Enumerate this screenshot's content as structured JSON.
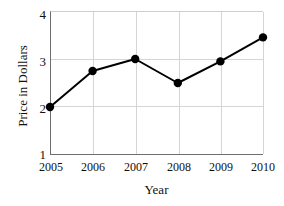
{
  "chart_data": {
    "type": "line",
    "title": "",
    "xlabel": "Year",
    "ylabel": "Price in Dollars",
    "categories": [
      "2005",
      "2006",
      "2007",
      "2008",
      "2009",
      "2010"
    ],
    "values": [
      2.0,
      2.75,
      3.0,
      2.5,
      2.95,
      3.45
    ],
    "series": [
      {
        "name": "Price",
        "values": [
          2.0,
          2.75,
          3.0,
          2.5,
          2.95,
          3.45
        ]
      }
    ],
    "x": [
      2005,
      2006,
      2007,
      2008,
      2009,
      2010
    ],
    "ylim": [
      1,
      4
    ],
    "yticks": [
      1,
      2,
      3,
      4
    ],
    "ytick_labels": [
      "1",
      "2",
      "3",
      "4"
    ],
    "xlim": [
      2005,
      2010
    ],
    "grid": true,
    "legend": "none",
    "marker": "filled-circle",
    "line_color": "#000000",
    "marker_color": "#000000",
    "grid_color": "#d5d5d5",
    "axis_color": "#6e6e6e"
  },
  "axes": {
    "y_title": "Price in Dollars",
    "x_title": "Year"
  }
}
